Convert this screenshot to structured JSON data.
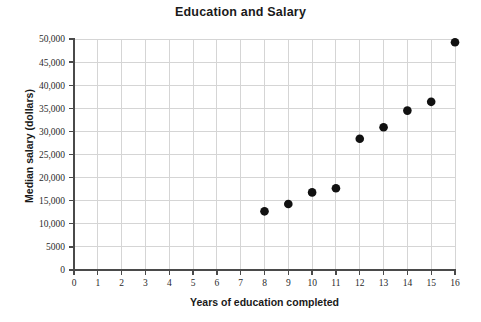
{
  "chart_data": {
    "type": "scatter",
    "title": "Education and Salary",
    "xlabel": "Years of education completed",
    "ylabel": "Median salary (dollars)",
    "xlim": [
      0,
      16
    ],
    "ylim": [
      0,
      50000
    ],
    "grid": true,
    "legend": null,
    "x_ticks": [
      0,
      1,
      2,
      3,
      4,
      5,
      6,
      7,
      8,
      9,
      10,
      11,
      12,
      13,
      14,
      15,
      16
    ],
    "x_tick_labels": [
      "0",
      "1",
      "2",
      "3",
      "4",
      "5",
      "6",
      "7",
      "8",
      "9",
      "10",
      "11",
      "12",
      "13",
      "14",
      "15",
      "16"
    ],
    "y_ticks": [
      0,
      5000,
      10000,
      15000,
      20000,
      25000,
      30000,
      35000,
      40000,
      45000,
      50000
    ],
    "y_tick_labels": [
      "0",
      "5000",
      "10,000",
      "15,000",
      "20,000",
      "25,000",
      "30,000",
      "35,000",
      "40,000",
      "45,000",
      "50,000"
    ],
    "x": [
      8,
      9,
      10,
      11,
      12,
      13,
      14,
      15,
      16
    ],
    "values": [
      12700,
      14300,
      16800,
      17700,
      28400,
      30900,
      34500,
      36400,
      49300
    ],
    "points": [
      {
        "x": 8,
        "y": 12700
      },
      {
        "x": 9,
        "y": 14300
      },
      {
        "x": 10,
        "y": 16800
      },
      {
        "x": 11,
        "y": 17700
      },
      {
        "x": 12,
        "y": 28400
      },
      {
        "x": 13,
        "y": 30900
      },
      {
        "x": 14,
        "y": 34500
      },
      {
        "x": 15,
        "y": 36400
      },
      {
        "x": 16,
        "y": 49300
      }
    ],
    "marker_color": "#111111",
    "grid_color": "#d5d5d5",
    "axis_color": "#4a4a4a"
  }
}
